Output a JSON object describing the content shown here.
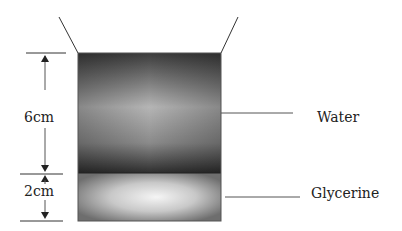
{
  "diagram": {
    "dimensions": [
      {
        "label": "6cm",
        "layer": "water"
      },
      {
        "label": "2cm",
        "layer": "glycerine"
      }
    ],
    "layers": [
      {
        "name": "Water",
        "height_cm": 6
      },
      {
        "name": "Glycerine",
        "height_cm": 2
      }
    ],
    "colors": {
      "water_dark": "#3a3a3a",
      "water_light": "#b8b8b8",
      "glycerine_edge": "#7a7a7a",
      "glycerine_center": "#f2f2f2",
      "line": "#333333"
    }
  }
}
